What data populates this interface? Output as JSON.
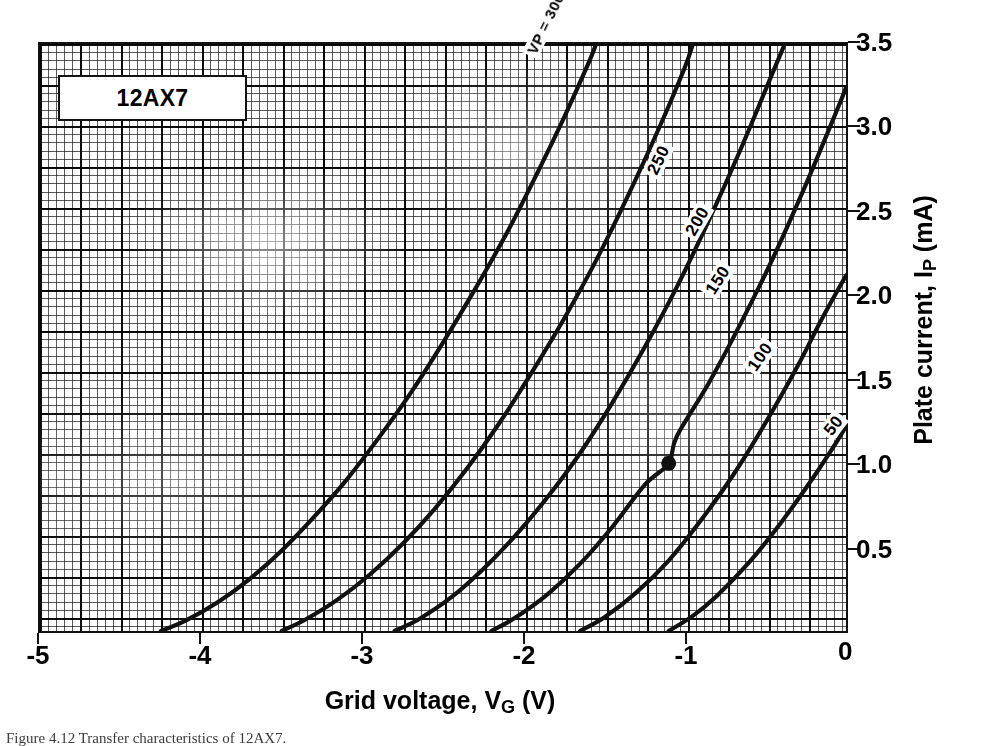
{
  "device": {
    "label": "12AX7"
  },
  "axes": {
    "x": {
      "title_prefix": "Grid voltage, V",
      "title_sub": "G",
      "title_suffix": " (V)",
      "ticks": [
        "-5",
        "-4",
        "-3",
        "-2",
        "-1",
        "0"
      ],
      "min": -5,
      "max": 0
    },
    "y": {
      "title_prefix": "Plate current, I",
      "title_sub": "P",
      "title_suffix": " (mA)",
      "ticks": [
        "0",
        "0.5",
        "1.0",
        "1.5",
        "2.0",
        "2.5",
        "3.0",
        "3.5"
      ],
      "min": 0,
      "max": 3.5
    }
  },
  "curve_labels": {
    "c300": "Vₚ = 300 VOLTS",
    "c300_plain": "VP = 300 VOLTS",
    "c250": "250",
    "c200": "200",
    "c150": "150",
    "c100": "100",
    "c50": "50"
  },
  "caption": "Figure 4.12  Transfer characteristics of 12AX7.",
  "colors": {
    "ink": "#111111",
    "grid_fine": "#4a4a4a",
    "grid_major": "#000000",
    "paper": "#ffffff"
  },
  "chart_data": {
    "type": "line",
    "title": "12AX7",
    "xlabel": "Grid voltage, VG (V)",
    "ylabel": "Plate current, IP (mA)",
    "xlim": [
      -5,
      0
    ],
    "ylim": [
      0,
      3.5
    ],
    "xticks": [
      -5,
      -4,
      -3,
      -2,
      -1,
      0
    ],
    "yticks": [
      0,
      0.5,
      1.0,
      1.5,
      2.0,
      2.5,
      3.0,
      3.5
    ],
    "grid": true,
    "grid_style": "graph-paper, fine 0.05 V / 0.0294 mA with major rules every 5 divisions",
    "legend": "inline curve labels along each trace",
    "series_parameter": "Plate voltage VP (volts)",
    "series": [
      {
        "name": "VP = 300 VOLTS",
        "vp": 300,
        "cutoff_vg": -4.25,
        "points": [
          {
            "vg": -4.25,
            "ip": 0.0
          },
          {
            "vg": -4.1,
            "ip": 0.06
          },
          {
            "vg": -3.9,
            "ip": 0.17
          },
          {
            "vg": -3.7,
            "ip": 0.31
          },
          {
            "vg": -3.5,
            "ip": 0.48
          },
          {
            "vg": -3.3,
            "ip": 0.68
          },
          {
            "vg": -3.1,
            "ip": 0.9
          },
          {
            "vg": -2.9,
            "ip": 1.15
          },
          {
            "vg": -2.7,
            "ip": 1.42
          },
          {
            "vg": -2.5,
            "ip": 1.72
          },
          {
            "vg": -2.3,
            "ip": 2.04
          },
          {
            "vg": -2.1,
            "ip": 2.38
          },
          {
            "vg": -1.9,
            "ip": 2.76
          },
          {
            "vg": -1.75,
            "ip": 3.06
          },
          {
            "vg": -1.6,
            "ip": 3.38
          },
          {
            "vg": -1.55,
            "ip": 3.5
          }
        ]
      },
      {
        "name": "250",
        "vp": 250,
        "cutoff_vg": -3.5,
        "points": [
          {
            "vg": -3.5,
            "ip": 0.0
          },
          {
            "vg": -3.35,
            "ip": 0.07
          },
          {
            "vg": -3.15,
            "ip": 0.19
          },
          {
            "vg": -2.95,
            "ip": 0.34
          },
          {
            "vg": -2.75,
            "ip": 0.52
          },
          {
            "vg": -2.55,
            "ip": 0.73
          },
          {
            "vg": -2.35,
            "ip": 0.97
          },
          {
            "vg": -2.15,
            "ip": 1.24
          },
          {
            "vg": -1.95,
            "ip": 1.54
          },
          {
            "vg": -1.75,
            "ip": 1.86
          },
          {
            "vg": -1.55,
            "ip": 2.21
          },
          {
            "vg": -1.35,
            "ip": 2.6
          },
          {
            "vg": -1.15,
            "ip": 3.02
          },
          {
            "vg": -1.0,
            "ip": 3.36
          },
          {
            "vg": -0.95,
            "ip": 3.5
          }
        ]
      },
      {
        "name": "200",
        "vp": 200,
        "cutoff_vg": -2.8,
        "points": [
          {
            "vg": -2.8,
            "ip": 0.0
          },
          {
            "vg": -2.65,
            "ip": 0.07
          },
          {
            "vg": -2.45,
            "ip": 0.2
          },
          {
            "vg": -2.25,
            "ip": 0.37
          },
          {
            "vg": -2.05,
            "ip": 0.57
          },
          {
            "vg": -1.85,
            "ip": 0.8
          },
          {
            "vg": -1.65,
            "ip": 1.06
          },
          {
            "vg": -1.45,
            "ip": 1.36
          },
          {
            "vg": -1.25,
            "ip": 1.69
          },
          {
            "vg": -1.05,
            "ip": 2.05
          },
          {
            "vg": -0.85,
            "ip": 2.45
          },
          {
            "vg": -0.65,
            "ip": 2.88
          },
          {
            "vg": -0.45,
            "ip": 3.34
          },
          {
            "vg": -0.38,
            "ip": 3.5
          }
        ]
      },
      {
        "name": "150",
        "vp": 150,
        "cutoff_vg": -2.2,
        "points": [
          {
            "vg": -2.2,
            "ip": 0.0
          },
          {
            "vg": -2.05,
            "ip": 0.08
          },
          {
            "vg": -1.85,
            "ip": 0.22
          },
          {
            "vg": -1.65,
            "ip": 0.4
          },
          {
            "vg": -1.45,
            "ip": 0.62
          },
          {
            "vg": -1.25,
            "ip": 0.87
          },
          {
            "vg": -1.1,
            "ip": 1.0
          },
          {
            "vg": -1.05,
            "ip": 1.16
          },
          {
            "vg": -0.85,
            "ip": 1.48
          },
          {
            "vg": -0.65,
            "ip": 1.84
          },
          {
            "vg": -0.45,
            "ip": 2.23
          },
          {
            "vg": -0.25,
            "ip": 2.66
          },
          {
            "vg": -0.05,
            "ip": 3.12
          },
          {
            "vg": 0.0,
            "ip": 3.24
          }
        ]
      },
      {
        "name": "100",
        "vp": 100,
        "cutoff_vg": -1.65,
        "points": [
          {
            "vg": -1.65,
            "ip": 0.0
          },
          {
            "vg": -1.5,
            "ip": 0.08
          },
          {
            "vg": -1.3,
            "ip": 0.23
          },
          {
            "vg": -1.1,
            "ip": 0.42
          },
          {
            "vg": -0.9,
            "ip": 0.66
          },
          {
            "vg": -0.7,
            "ip": 0.93
          },
          {
            "vg": -0.5,
            "ip": 1.24
          },
          {
            "vg": -0.3,
            "ip": 1.58
          },
          {
            "vg": -0.15,
            "ip": 1.86
          },
          {
            "vg": 0.0,
            "ip": 2.12
          }
        ]
      },
      {
        "name": "50",
        "vp": 50,
        "cutoff_vg": -1.1,
        "points": [
          {
            "vg": -1.1,
            "ip": 0.0
          },
          {
            "vg": -0.95,
            "ip": 0.09
          },
          {
            "vg": -0.8,
            "ip": 0.21
          },
          {
            "vg": -0.6,
            "ip": 0.41
          },
          {
            "vg": -0.4,
            "ip": 0.65
          },
          {
            "vg": -0.2,
            "ip": 0.92
          },
          {
            "vg": -0.05,
            "ip": 1.14
          },
          {
            "vg": 0.0,
            "ip": 1.22
          }
        ]
      }
    ],
    "annotations": [
      {
        "type": "operating-point",
        "marker": "filled-circle",
        "vg": -1.1,
        "ip": 1.0,
        "on_series": "150"
      }
    ]
  }
}
